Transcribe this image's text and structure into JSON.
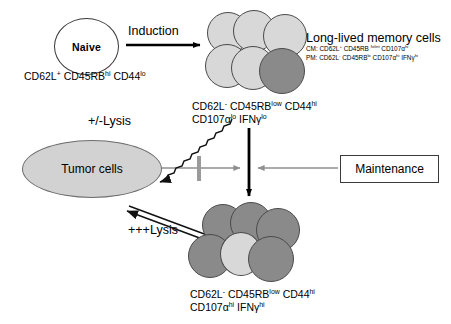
{
  "diagram": {
    "naive": {
      "label": "Naive",
      "phenotype_html": "CD62L<sup>+</sup> CD45RB<sup>hi</sup> CD44<sup>lo</sup>"
    },
    "induction_label": "Induction",
    "memory": {
      "title": "Long-lived memory cells",
      "cm_html": "CM: CD62L<sup>+</sup> CD45RB <sup>hi/int</sup> CD107&alpha;<sup>hi</sup>",
      "pm_html": "PM: CD62L<sup>-</sup> CD45RB<sup>lo</sup> CD107&alpha;<sup>hi</sup> IFN&gamma;<sup>hi</sup>",
      "phenotype_line1_html": "CD62L<sup>-</sup> CD45RB<sup>low</sup> CD44<sup>hi</sup>",
      "phenotype_line2_html": "CD107&alpha;<sup>lo</sup> IFN&gamma;<sup>lo</sup>"
    },
    "effector": {
      "phenotype_line1_html": "CD62L<sup>-</sup> CD45RB<sup>low</sup> CD44<sup>hi</sup>",
      "phenotype_line2_html": "CD107&alpha;<sup>hi</sup> IFN&gamma;<sup>hi</sup>"
    },
    "tumor_label": "Tumor cells",
    "partial_lysis_label": "+/-Lysis",
    "strong_lysis_label": "+++Lysis",
    "maintenance_label": "Maintenance",
    "colors": {
      "cell_light": "#d8d8d8",
      "cell_dark": "#8a8a8a",
      "tumor_fill": "#d2d2d2",
      "outline": "#4a4a4a",
      "arrow_black": "#000000",
      "arrow_gray": "#8f8f8f"
    },
    "memory_cluster_cells": [
      {
        "shade": "light"
      },
      {
        "shade": "light"
      },
      {
        "shade": "light"
      },
      {
        "shade": "light"
      },
      {
        "shade": "light"
      },
      {
        "shade": "dark"
      }
    ],
    "effector_cluster_cells": [
      {
        "shade": "dark"
      },
      {
        "shade": "dark"
      },
      {
        "shade": "dark"
      },
      {
        "shade": "dark"
      },
      {
        "shade": "light"
      },
      {
        "shade": "dark"
      }
    ]
  }
}
